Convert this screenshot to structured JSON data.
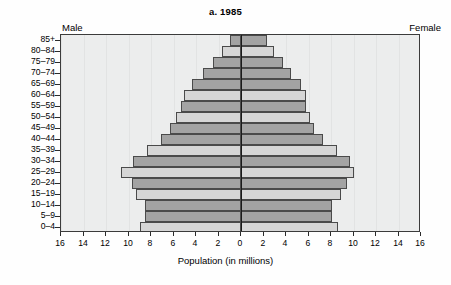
{
  "chart_data": {
    "type": "bar",
    "subtype": "population-pyramid",
    "title": "a. 1985",
    "xlabel": "Population (in millions)",
    "ylabel": "",
    "xlim": [
      -16,
      16
    ],
    "x_ticks": [
      16,
      14,
      12,
      10,
      8,
      6,
      4,
      2,
      0,
      2,
      4,
      6,
      8,
      10,
      12,
      14,
      16
    ],
    "grid": true,
    "legend_position": "above-plot",
    "left_side_label": "Male",
    "right_side_label": "Female",
    "categories": [
      "85+",
      "80–84",
      "75–79",
      "70–74",
      "65–69",
      "60–64",
      "55–59",
      "50–54",
      "45–49",
      "40–44",
      "35–39",
      "30–34",
      "25–29",
      "20–24",
      "15–19",
      "10–14",
      "5–9",
      "0–4"
    ],
    "series": [
      {
        "name": "Male",
        "values": [
          1.0,
          1.7,
          2.5,
          3.4,
          4.4,
          5.1,
          5.3,
          5.8,
          6.3,
          7.1,
          8.4,
          9.6,
          10.7,
          9.7,
          9.3,
          8.5,
          8.5,
          9.0
        ]
      },
      {
        "name": "Female",
        "values": [
          2.3,
          2.9,
          3.7,
          4.4,
          5.3,
          5.8,
          5.8,
          6.1,
          6.5,
          7.3,
          8.5,
          9.7,
          10.0,
          9.4,
          8.9,
          8.1,
          8.1,
          8.6
        ]
      }
    ],
    "bar_shading": [
      "dark",
      "light",
      "dark",
      "dark",
      "dark",
      "light",
      "dark",
      "light",
      "dark",
      "dark",
      "light",
      "dark",
      "light",
      "dark",
      "light",
      "dark",
      "dark",
      "light"
    ]
  },
  "colors": {
    "bar_dark": "#a3a3a3",
    "bar_light": "#d6d6d6",
    "plot_background": "#eceded",
    "axis": "#1a1a1a",
    "grid": "#e2e3e3"
  }
}
